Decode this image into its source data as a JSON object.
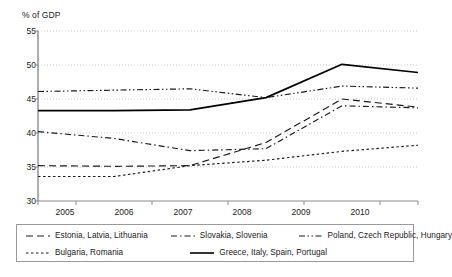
{
  "chart_data": {
    "type": "line",
    "title": "",
    "subtitle": "",
    "ylabel": "% of GDP",
    "xlabel": "",
    "x": [
      2005,
      2006,
      2007,
      2008,
      2009,
      2010
    ],
    "categories": [
      "2005",
      "2006",
      "2007",
      "2008",
      "2009",
      "2010"
    ],
    "ylim": [
      30,
      55
    ],
    "yticks": [
      30,
      35,
      40,
      45,
      50,
      55
    ],
    "ytick_labels": [
      "30",
      "35",
      "40",
      "45",
      "50",
      "55"
    ],
    "xtick_labels": [
      "2005",
      "2006",
      "2007",
      "2008",
      "2009",
      "2010"
    ],
    "grid": "horizontal-dotted",
    "legend_position": "bottom-boxed",
    "series": [
      {
        "name": "Estonia, Latvia, Lithuania",
        "style": "dashed",
        "color": "#1a1a1a",
        "values": [
          35.2,
          35.1,
          35.2,
          38.6,
          45.0,
          43.8
        ]
      },
      {
        "name": "Slovakia, Slovenia",
        "style": "dash-dot",
        "color": "#1a1a1a",
        "values": [
          40.2,
          39.2,
          37.4,
          37.7,
          44.0,
          43.7
        ]
      },
      {
        "name": "Poland, Czech Republic, Hungary",
        "style": "dash-dot-dot",
        "color": "#1a1a1a",
        "values": [
          46.1,
          46.3,
          46.5,
          45.2,
          46.9,
          46.6
        ]
      },
      {
        "name": "Bulgaria, Romania",
        "style": "dotted",
        "color": "#1a1a1a",
        "values": [
          33.6,
          33.6,
          35.2,
          36.0,
          37.3,
          38.2
        ]
      },
      {
        "name": "Greece, Italy, Spain, Portugal",
        "style": "solid",
        "color": "#000000",
        "values": [
          43.3,
          43.3,
          43.4,
          45.2,
          50.1,
          48.9
        ]
      }
    ]
  },
  "axes": {
    "y_axis_title": "% of GDP",
    "y_ticks": [
      "55",
      "50",
      "45",
      "40",
      "35",
      "30"
    ],
    "x_ticks": [
      "2005",
      "2006",
      "2007",
      "2008",
      "2009",
      "2010"
    ]
  },
  "legend": {
    "entries": [
      {
        "label": "Estonia, Latvia, Lithuania",
        "style": "dashed"
      },
      {
        "label": "Slovakia, Slovenia",
        "style": "dash-dot"
      },
      {
        "label": "Poland, Czech Republic, Hungary",
        "style": "dash-dot-dot"
      },
      {
        "label": "Bulgaria, Romania",
        "style": "dotted"
      },
      {
        "label": "Greece, Italy, Spain, Portugal",
        "style": "solid"
      }
    ]
  },
  "colors": {
    "line": "#1a1a1a",
    "grid": "#bdbdbd",
    "axis": "#8c8c8c",
    "legend_border": "#9a9a9a",
    "background": "#ffffff"
  }
}
